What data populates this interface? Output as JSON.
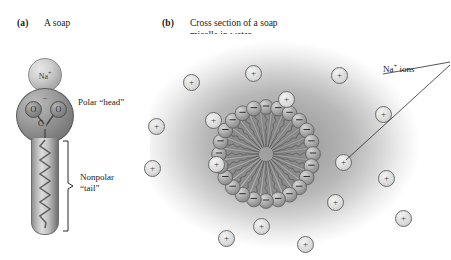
{
  "figure": {
    "panels": [
      {
        "tag": "(a)",
        "caption": "A soap"
      },
      {
        "tag": "(b)",
        "caption": "Cross section of a soap micelle in water"
      }
    ]
  },
  "panel_a": {
    "sodium_sphere": {
      "label": "Na",
      "charge": "+"
    },
    "head_group": {
      "oxygen_left": "O",
      "oxygen_right": "O",
      "carbon": "C",
      "charge": "−"
    },
    "labels": {
      "polar_head": "Polar “head”",
      "nonpolar_tail_line1": "Nonpolar",
      "nonpolar_tail_line2": "“tail”"
    }
  },
  "panel_b": {
    "annotation": {
      "text": "Na",
      "charge": "+",
      "suffix": " ions"
    },
    "micelle": {
      "head_count": 24,
      "head_charge": "−",
      "core_description": "nonpolar tails pointing inward"
    },
    "sodium_ions": {
      "symbol": "+",
      "count": 16,
      "positions": [
        [
          33,
          40
        ],
        [
          95,
          31
        ],
        [
          128,
          57
        ],
        [
          181,
          33
        ],
        [
          225,
          72
        ],
        [
          -2,
          84
        ],
        [
          -6,
          126
        ],
        [
          55,
          78
        ],
        [
          58,
          122
        ],
        [
          185,
          120
        ],
        [
          228,
          136
        ],
        [
          245,
          176
        ],
        [
          177,
          160
        ],
        [
          103,
          184
        ],
        [
          68,
          196
        ],
        [
          147,
          202
        ]
      ]
    },
    "leader_lines": [
      {
        "from": [
          233,
          40
        ],
        "to": [
          300,
          28
        ]
      },
      {
        "from": [
          196,
          126
        ],
        "to": [
          300,
          31
        ]
      }
    ]
  },
  "colors": {
    "background": "#ffffff",
    "water_core": "#9b9b9b",
    "text": "#1a1a1a",
    "sphere_outline": "#5a5a5a"
  },
  "chart_data": {
    "type": "diagram"
  }
}
